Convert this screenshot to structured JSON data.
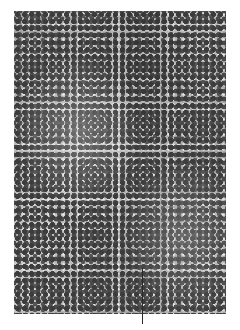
{
  "image": {
    "description": "Grayscale histology micrograph showing densely packed small round dark-staining cell nuclei",
    "colors": {
      "background": "#ffffff",
      "nuclei": "#3c3c3c",
      "stroma": "#b5b5b5",
      "leader_line": "#2a2a2a"
    }
  },
  "annotation": {
    "type": "leader-line",
    "label": ""
  }
}
